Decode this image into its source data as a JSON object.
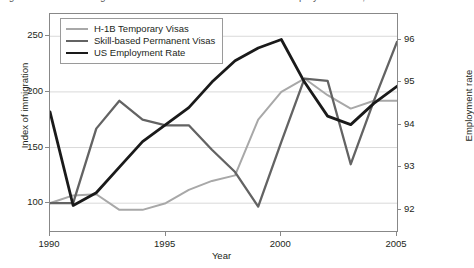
{
  "title_sliver": "Figure 3: Skilled immigration to the United States and the US employment rate, 1990–2005",
  "axes": {
    "ylabel": "Index of immigration",
    "y2label": "Employment rate",
    "xlabel": "Year",
    "yticks": [
      "100",
      "150",
      "200",
      "250"
    ],
    "y2ticks": [
      "92",
      "93",
      "94",
      "95",
      "96"
    ],
    "xticks": [
      "1990",
      "1995",
      "2000",
      "2005"
    ]
  },
  "legend": {
    "items": [
      {
        "label": "H-1B Temporary Visas",
        "color": "#a8a8a8"
      },
      {
        "label": "Skill-based Permanent Visas",
        "color": "#636363"
      },
      {
        "label": "US Employment Rate",
        "color": "#1a1a1a"
      }
    ]
  },
  "colors": {
    "h1b": "#a8a8a8",
    "permanent": "#636363",
    "employment": "#1a1a1a",
    "grid": "#d9d9d9",
    "frame": "#888888"
  },
  "chart_data": {
    "type": "line",
    "title": "Skilled immigration to the United States and the US employment rate",
    "xlabel": "Year",
    "ylabel": "Index of immigration",
    "y2label": "Employment rate",
    "xlim": [
      1990,
      2005
    ],
    "ylim": [
      75,
      270
    ],
    "y2lim": [
      91.5,
      96.6
    ],
    "grid": "horizontal",
    "legend_position": "top-left-inside",
    "x": [
      1990,
      1991,
      1992,
      1993,
      1994,
      1995,
      1996,
      1997,
      1998,
      1999,
      2000,
      2001,
      2002,
      2003,
      2004,
      2005
    ],
    "series": [
      {
        "name": "H-1B Temporary Visas",
        "axis": "left",
        "color": "#a8a8a8",
        "values": [
          100,
          107,
          108,
          94,
          94,
          100,
          112,
          120,
          125,
          175,
          200,
          212,
          197,
          185,
          192,
          192
        ]
      },
      {
        "name": "Skill-based Permanent Visas",
        "axis": "left",
        "color": "#636363",
        "values": [
          100,
          100,
          167,
          192,
          175,
          170,
          170,
          148,
          128,
          97,
          155,
          212,
          210,
          135,
          192,
          245
        ]
      },
      {
        "name": "US Employment Rate",
        "axis": "right",
        "color": "#1a1a1a",
        "values": [
          94.3,
          92.1,
          92.4,
          93.0,
          93.6,
          94.0,
          94.4,
          95.0,
          95.5,
          95.8,
          96.0,
          95.0,
          94.2,
          94.0,
          94.5,
          94.9
        ]
      }
    ]
  }
}
